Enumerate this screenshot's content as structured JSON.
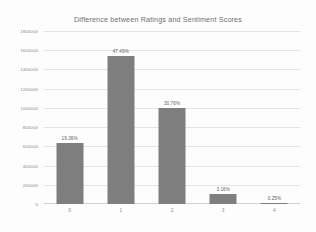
{
  "chart_data": {
    "type": "bar",
    "title": "Difference between Ratings and Sentiment Scores",
    "xlabel": "",
    "ylabel": "",
    "categories": [
      "0",
      "1",
      "2",
      "3",
      "4"
    ],
    "values": [
      630000,
      1540000,
      1000000,
      103000,
      8000
    ],
    "data_labels": [
      "19.36%",
      "47.49%",
      "30.76%",
      "3.16%",
      "0.25%"
    ],
    "ylim": [
      0,
      1800000
    ],
    "yticks": [
      0,
      200000,
      400000,
      600000,
      800000,
      1000000,
      1200000,
      1400000,
      1600000,
      1800000
    ],
    "ytick_labels": [
      "0",
      "200000",
      "400000",
      "600000",
      "800000",
      "1000000",
      "1200000",
      "1400000",
      "1600000",
      "1800000"
    ],
    "grid": true,
    "legend": false,
    "legend_position": "none",
    "series": [
      {
        "name": "Count",
        "values": [
          630000,
          1540000,
          1000000,
          103000,
          8000
        ]
      }
    ],
    "colors": {
      "bar": "#7e7e7e",
      "gridline": "#e4e4e4",
      "axis": "#d2d2d2",
      "title_text": "#6f6f6f",
      "tick_text": "#8a8a8a",
      "label_text": "#5e5e5e",
      "background": "#fdfdfd"
    }
  }
}
